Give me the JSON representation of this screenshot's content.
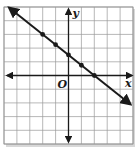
{
  "chart_data": {
    "type": "line",
    "title": "",
    "xlabel": "x",
    "ylabel": "y",
    "origin_label": "O",
    "xlim": [
      -5,
      5
    ],
    "ylim": [
      -5,
      5
    ],
    "grid": true,
    "tick_labels": false,
    "series": [
      {
        "name": "line",
        "equation": "y = -3/4 x + 3/2",
        "x": [
          -2,
          -1,
          0,
          1,
          2
        ],
        "y": [
          3,
          2.25,
          1.5,
          0.75,
          0
        ],
        "extends_with_arrows": true,
        "markers": true
      }
    ]
  },
  "labels": {
    "x_axis": "x",
    "y_axis": "y",
    "origin": "O"
  },
  "colors": {
    "grid": "#9a9a9a",
    "axis": "#1a1a1a",
    "line": "#1a1a1a",
    "background": "#ffffff",
    "frame_shadow": "#cfcfcf"
  }
}
